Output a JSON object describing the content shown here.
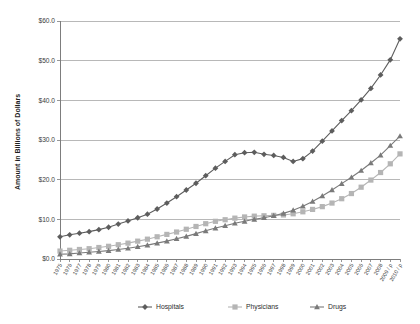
{
  "chart_data": {
    "type": "line",
    "title": "",
    "xlabel": "",
    "ylabel": "Amount in Billions of Dollars",
    "ylim": [
      0,
      60
    ],
    "yticks": [
      0,
      10,
      20,
      30,
      40,
      50,
      60
    ],
    "ytick_labels": [
      "$0.0",
      "$10.0",
      "$20.0",
      "$30.0",
      "$40.0",
      "$50.0",
      "$60.0"
    ],
    "grid": true,
    "legend_position": "bottom",
    "categories": [
      "1975",
      "1976",
      "1977",
      "1978",
      "1979",
      "1980",
      "1981",
      "1982",
      "1983",
      "1984",
      "1985",
      "1986",
      "1987",
      "1988",
      "1989",
      "1990",
      "1991",
      "1992",
      "1993",
      "1994",
      "1995",
      "1996",
      "1997",
      "1998",
      "1999",
      "2000",
      "2001",
      "2002",
      "2003",
      "2004",
      "2005",
      "2006",
      "2007",
      "2008",
      "2009 / p",
      "2010 / p"
    ],
    "series": [
      {
        "name": "Hospitals",
        "color": "#5d5d5d",
        "marker": "diamond",
        "values": [
          5.6,
          6.1,
          6.5,
          6.9,
          7.4,
          8.0,
          8.8,
          9.6,
          10.4,
          11.3,
          12.6,
          14.1,
          15.7,
          17.4,
          19.1,
          21.0,
          22.9,
          24.6,
          26.3,
          26.8,
          26.9,
          26.4,
          26.1,
          25.6,
          24.6,
          25.3,
          27.2,
          29.7,
          32.3,
          34.9,
          37.4,
          40.1,
          43.0,
          46.4,
          50.2,
          55.5
        ]
      },
      {
        "name": "Physicians",
        "color": "#b5b5b5",
        "marker": "square",
        "values": [
          2.0,
          2.2,
          2.4,
          2.6,
          2.9,
          3.2,
          3.6,
          4.0,
          4.5,
          5.0,
          5.6,
          6.2,
          6.8,
          7.5,
          8.2,
          8.9,
          9.5,
          9.9,
          10.3,
          10.6,
          10.8,
          10.9,
          11.0,
          11.1,
          11.4,
          11.9,
          12.5,
          13.2,
          14.1,
          15.2,
          16.5,
          18.1,
          19.9,
          21.8,
          24.0,
          26.5
        ]
      },
      {
        "name": "Drugs",
        "color": "#7a7a7a",
        "marker": "triangle",
        "values": [
          1.2,
          1.3,
          1.5,
          1.7,
          1.9,
          2.1,
          2.4,
          2.7,
          3.1,
          3.5,
          4.0,
          4.5,
          5.1,
          5.7,
          6.4,
          7.1,
          7.8,
          8.4,
          9.0,
          9.5,
          10.0,
          10.4,
          10.9,
          11.5,
          12.3,
          13.3,
          14.5,
          15.9,
          17.4,
          19.0,
          20.6,
          22.3,
          24.2,
          26.2,
          28.6,
          31.0
        ]
      }
    ]
  },
  "legend": {
    "items": [
      {
        "label": "Hospitals"
      },
      {
        "label": "Physicians"
      },
      {
        "label": "Drugs"
      }
    ]
  }
}
